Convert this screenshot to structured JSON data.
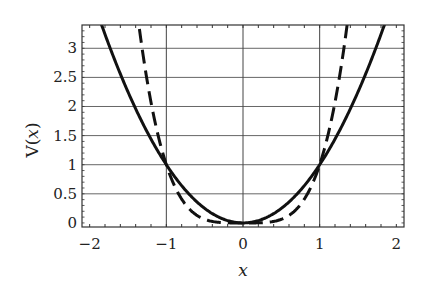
{
  "chart_data": {
    "type": "line",
    "title": "",
    "xlabel": "x",
    "ylabel": "V(x)",
    "xlim": [
      -2.1,
      2.1
    ],
    "ylim": [
      -0.07,
      3.4
    ],
    "x_ticks": [
      -2,
      -1,
      0,
      1,
      2
    ],
    "x_tick_labels": [
      "−2",
      "−1",
      "0",
      "1",
      "2"
    ],
    "y_ticks": [
      0,
      0.5,
      1,
      1.5,
      2,
      2.5,
      3
    ],
    "y_tick_labels": [
      "0",
      "0.5",
      "1",
      "1.5",
      "2",
      "2.5",
      "3"
    ],
    "x_minor_tick_step": 0.2,
    "grid": {
      "horizontal": [
        0.5,
        1,
        1.5,
        2,
        2.5,
        3
      ],
      "vertical": [
        -1,
        0,
        1
      ]
    },
    "legend": null,
    "series": [
      {
        "name": "V(x) = x^2",
        "style": "solid",
        "color": "#111111",
        "function": "x^2",
        "x": [
          -1.83,
          -1.5,
          -1.0,
          -0.5,
          0,
          0.5,
          1.0,
          1.5,
          1.83
        ],
        "values": [
          3.35,
          2.25,
          1.0,
          0.25,
          0,
          0.25,
          1.0,
          2.25,
          3.35
        ]
      },
      {
        "name": "V(x) = x^4",
        "style": "dashed",
        "color": "#111111",
        "function": "x^4",
        "x": [
          -1.36,
          -1.2,
          -1.0,
          -0.5,
          0,
          0.5,
          1.0,
          1.2,
          1.36
        ],
        "values": [
          3.4,
          2.07,
          1.0,
          0.06,
          0,
          0.06,
          1.0,
          2.07,
          3.4
        ]
      }
    ]
  }
}
